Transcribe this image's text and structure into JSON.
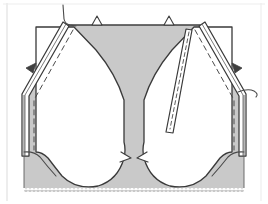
{
  "figure": {
    "title": "Sewing pattern construction diagram",
    "description": "Symmetric garment panel with folded-back seam allowances, basting stitch lines, balance notches and a pinked lower edge.",
    "canvas": {
      "width": 268,
      "height": 204
    },
    "colors": {
      "fabric_fill": "#c9c9c9",
      "lining_fill": "#ffffff",
      "outline": "#3a3a3a",
      "stitch_line": "#4a4a4a",
      "background": "#ffffff",
      "frame": "#e2e2e2",
      "shadow": "#9a9a9a"
    },
    "parts": [
      {
        "name": "main-fabric-panel",
        "label": "Fabric panel",
        "fill": "fabric_fill"
      },
      {
        "name": "left-facing-opening",
        "label": "Left facing opening",
        "fill": "lining_fill"
      },
      {
        "name": "right-facing-opening",
        "label": "Right facing opening",
        "fill": "lining_fill"
      },
      {
        "name": "left-seam-allowance",
        "label": "Left folded seam allowance",
        "fill": "lining_fill"
      },
      {
        "name": "right-seam-allowance",
        "label": "Right folded seam allowance",
        "fill": "lining_fill"
      }
    ],
    "markings": [
      {
        "name": "top-notch-left",
        "type": "triangular-notch",
        "x": 96,
        "y": 21
      },
      {
        "name": "top-notch-right",
        "type": "triangular-notch",
        "x": 168,
        "y": 21
      },
      {
        "name": "left-seam-notch",
        "type": "balance-notch",
        "x": 31,
        "y": 65
      },
      {
        "name": "right-seam-notch",
        "type": "balance-notch",
        "x": 235,
        "y": 65
      },
      {
        "name": "left-thread-tail",
        "type": "thread-tail",
        "x": 63,
        "y": 8
      },
      {
        "name": "right-thread-tail",
        "type": "thread-tail",
        "x": 250,
        "y": 85
      },
      {
        "name": "left-basting-line",
        "type": "dashed-stitch-line"
      },
      {
        "name": "right-basting-line",
        "type": "dashed-stitch-line"
      },
      {
        "name": "right-topstitch-line",
        "type": "dashed-stitch-line"
      },
      {
        "name": "pinked-hem-edge",
        "type": "sawtooth-edge",
        "y": 191
      }
    ],
    "geometry": {
      "fabric_outline": "M 22,93 L 22,190 L 246,190 L 246,93 L 196,24 L 72,24 Z",
      "left_opening": "M 40,93 L 40,160 Q 40,176 52,184 Q 72,196 96,190 Q 118,183 124,160 L 124,94 Q 112,70 86,45 L 62,27 L 40,27 Z",
      "right_opening": "M 228,93 L 228,160 Q 228,176 216,184 Q 196,196 172,190 Q 150,183 144,160 L 144,94 Q 156,70 182,45 L 206,27 L 228,27 Z",
      "left_allowance": "M 20,95 L 20,160 L 26,160 L 26,96 L 70,28 L 66,24 Z",
      "right_allowance": "M 248,95 L 248,160 L 242,160 L 242,96 L 198,28 L 202,24 Z"
    }
  }
}
